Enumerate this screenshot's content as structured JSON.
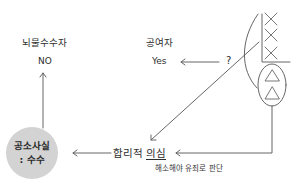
{
  "diagram": {
    "bribe_receiver": {
      "title": "뇌물수수자",
      "value": "NO"
    },
    "bribe_giver": {
      "title": "공여자",
      "value": "Yes"
    },
    "question_mark": "?",
    "indicted_fact": {
      "line1": "공소사실",
      "line2": ": 수수"
    },
    "reasonable_doubt": {
      "prefix": "합리적 ",
      "underlined": "의심"
    },
    "note": "해소해야 유죄로 판단",
    "evidence_column": {
      "x_marks": 3,
      "triangle_marks": 2
    },
    "colors": {
      "line": "#555555",
      "circle_fill": "#d3d3d3",
      "text": "#2e2e2e"
    }
  }
}
